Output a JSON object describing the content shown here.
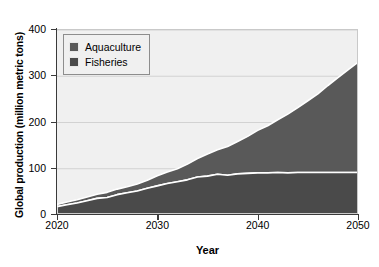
{
  "chart_data": {
    "type": "area",
    "stacked": true,
    "title": "",
    "xlabel": "Year",
    "ylabel": "Global production (million metric tons)",
    "xlim": [
      2020,
      2050
    ],
    "ylim": [
      0,
      400
    ],
    "xticks": [
      2020,
      2030,
      2040,
      2050
    ],
    "yticks": [
      0,
      100,
      200,
      300,
      400
    ],
    "grid": "horizontal",
    "legend_position": "upper-left",
    "x": [
      2020,
      2021,
      2022,
      2023,
      2024,
      2025,
      2026,
      2027,
      2028,
      2029,
      2030,
      2031,
      2032,
      2033,
      2034,
      2035,
      2036,
      2037,
      2038,
      2039,
      2040,
      2041,
      2042,
      2043,
      2044,
      2045,
      2046,
      2047,
      2048,
      2049,
      2050
    ],
    "series": [
      {
        "name": "Fisheries",
        "color": "#4a4a4a",
        "values": [
          18,
          22,
          26,
          31,
          36,
          38,
          44,
          48,
          52,
          58,
          63,
          68,
          72,
          76,
          82,
          84,
          88,
          86,
          89,
          90,
          91,
          91,
          92,
          91,
          92,
          92,
          92,
          92,
          92,
          92,
          92
        ]
      },
      {
        "name": "Aquaculture",
        "color": "#595959",
        "values": [
          5,
          6,
          7,
          8,
          9,
          11,
          12,
          13,
          15,
          17,
          22,
          25,
          28,
          34,
          40,
          48,
          53,
          62,
          70,
          80,
          92,
          102,
          114,
          127,
          140,
          155,
          170,
          188,
          205,
          222,
          238
        ]
      }
    ],
    "totals": [
      23,
      28,
      33,
      39,
      45,
      49,
      56,
      61,
      67,
      75,
      85,
      93,
      100,
      110,
      122,
      132,
      141,
      148,
      159,
      170,
      183,
      193,
      206,
      218,
      232,
      247,
      262,
      280,
      297,
      314,
      330
    ]
  },
  "legend": {
    "items": [
      {
        "label": "Aquaculture",
        "color": "#595959"
      },
      {
        "label": "Fisheries",
        "color": "#4a4a4a"
      }
    ]
  },
  "axes": {
    "y_title": "Global production (million metric tons)",
    "x_title": "Year",
    "y_ticks": [
      "400",
      "300",
      "200",
      "100",
      "0"
    ],
    "x_ticks": [
      "2020",
      "2030",
      "2040",
      "2050"
    ]
  }
}
